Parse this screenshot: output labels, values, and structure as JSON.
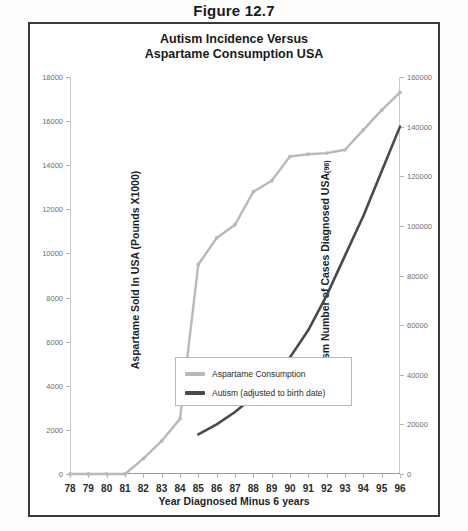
{
  "figure": {
    "caption": "Figure 12.7"
  },
  "chart_title": {
    "line1": "Autism Incidence Versus",
    "line2": "Aspartame Consumption USA"
  },
  "axes": {
    "y_left_title": "Aspartame Sold In USA  (Pounds X1000)",
    "y_right_title_main": "Autism Number of Cases Diagnosed USA",
    "y_right_title_sub": "(98)",
    "x_title": "Year Diagnosed Minus 6 years"
  },
  "legend": {
    "items": [
      {
        "label": "Aspartame Consumption",
        "color": "#b9b9b9"
      },
      {
        "label": "Autism (adjusted to birth date)",
        "color": "#4a4a4a"
      }
    ]
  },
  "chart_data": {
    "type": "line",
    "title": "Autism Incidence Versus Aspartame Consumption USA",
    "xlabel": "Year Diagnosed Minus 6 years",
    "ylabel": "Aspartame Sold In USA  (Pounds X1000)",
    "ylabel_right": "Autism Number of Cases Diagnosed USA(98)",
    "grid": false,
    "legend_position": "inside-bottom-right",
    "categories": [
      78,
      79,
      80,
      81,
      82,
      83,
      84,
      85,
      86,
      87,
      88,
      89,
      90,
      91,
      92,
      93,
      94,
      95,
      96
    ],
    "x_tick_labels": [
      "78",
      "79",
      "80",
      "81",
      "82",
      "83",
      "84",
      "85",
      "86",
      "87",
      "88",
      "89",
      "90",
      "91",
      "92",
      "93",
      "94",
      "95",
      "96"
    ],
    "ylim": [
      0,
      18000
    ],
    "y_tick_labels": [
      "0",
      "2000",
      "4000",
      "6000",
      "8000",
      "10000",
      "12000",
      "14000",
      "16000",
      "18000"
    ],
    "y_ticks": [
      0,
      2000,
      4000,
      6000,
      8000,
      10000,
      12000,
      14000,
      16000,
      18000
    ],
    "ylim_right": [
      0,
      160000
    ],
    "y_right_tick_labels": [
      "0",
      "20000",
      "40000",
      "60000",
      "80000",
      "100000",
      "120000",
      "140000",
      "160000"
    ],
    "y_right_ticks": [
      0,
      20000,
      40000,
      60000,
      80000,
      100000,
      120000,
      140000,
      160000
    ],
    "series": [
      {
        "name": "Aspartame Consumption",
        "axis": "left",
        "color": "#b9b9b9",
        "values": [
          0,
          0,
          0,
          0,
          700,
          1500,
          2500,
          9500,
          10700,
          11300,
          12800,
          13300,
          14400,
          14500,
          14550,
          14700,
          15600,
          16500,
          17300
        ]
      },
      {
        "name": "Autism (adjusted to birth date)",
        "axis": "right",
        "color": "#4a4a4a",
        "values": [
          null,
          null,
          null,
          null,
          null,
          null,
          null,
          16000,
          20000,
          25000,
          31000,
          38000,
          47000,
          58000,
          72000,
          88000,
          104000,
          122000,
          140000
        ]
      }
    ]
  }
}
